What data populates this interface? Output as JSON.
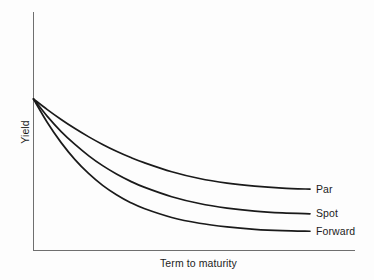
{
  "chart_data": {
    "type": "line",
    "title": "",
    "subtitle": "",
    "xlabel": "Term to maturity",
    "ylabel": "Yield",
    "grid": false,
    "legend_position": "right-inline-end-of-line",
    "axis_ranges": {
      "x": [
        0,
        1
      ],
      "y": [
        0,
        1
      ]
    },
    "x_tick_labels": [],
    "y_tick_labels": [],
    "x": [
      0.0,
      0.05,
      0.1,
      0.15,
      0.2,
      0.25,
      0.3,
      0.35,
      0.4,
      0.5,
      0.6,
      0.7,
      0.8,
      0.9,
      1.0
    ],
    "series": [
      {
        "name": "Par",
        "label": "Par",
        "color": "#1a1a1a",
        "values": [
          1.0,
          0.93,
          0.865,
          0.805,
          0.75,
          0.7,
          0.655,
          0.615,
          0.58,
          0.52,
          0.475,
          0.445,
          0.425,
          0.412,
          0.405
        ]
      },
      {
        "name": "Spot",
        "label": "Spot",
        "color": "#1a1a1a",
        "values": [
          1.0,
          0.885,
          0.785,
          0.7,
          0.625,
          0.56,
          0.505,
          0.458,
          0.418,
          0.355,
          0.31,
          0.28,
          0.26,
          0.248,
          0.242
        ]
      },
      {
        "name": "Forward",
        "label": "Forward",
        "color": "#1a1a1a",
        "values": [
          1.0,
          0.845,
          0.712,
          0.6,
          0.507,
          0.43,
          0.368,
          0.317,
          0.277,
          0.218,
          0.18,
          0.156,
          0.14,
          0.131,
          0.127
        ]
      }
    ]
  },
  "axes": {
    "y_axis_label": "Yield",
    "x_axis_label": "Term to maturity"
  },
  "labels": {
    "par": "Par",
    "spot": "Spot",
    "forward": "Forward"
  },
  "colors": {
    "background": "#fdfdfd",
    "axis": "#6f6f6f",
    "curve": "#1a1a1a",
    "text": "#1c1c1c"
  }
}
